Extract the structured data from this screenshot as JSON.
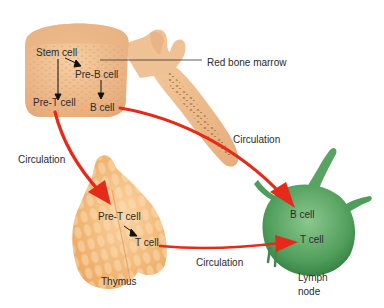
{
  "diagram": {
    "organs": {
      "bone_marrow": {
        "name": "Red bone marrow",
        "cells": [
          "Stem cell",
          "Pre-B cell",
          "Pre-T cell",
          "B cell"
        ]
      },
      "thymus": {
        "name": "Thymus",
        "cells": [
          "Pre-T cell",
          "T cell"
        ]
      },
      "lymph_node": {
        "name_line1": "Lymph",
        "name_line2": "node",
        "cells": [
          "B cell",
          "T cell"
        ]
      }
    },
    "pathways": {
      "marrow_to_lymph": "Circulation",
      "marrow_to_thymus": "Circulation",
      "thymus_to_lymph": "Circulation"
    },
    "colors": {
      "bone": "#f0c090",
      "bone_shadow": "#d99e6c",
      "thymus": "#f3b878",
      "lymph_node": "#5aa463",
      "lymph_node_dark": "#2f7a3c",
      "arrow": "#e52a1a",
      "text": "#2b2b2b"
    }
  }
}
